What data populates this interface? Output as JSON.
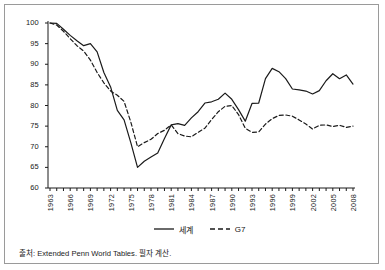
{
  "figure": {
    "source_note": "출처: Extended Penn World Tables. 필자 계산.",
    "border_color": "#9a9a9a",
    "line_color": "#1a1a1a"
  },
  "chart_data": {
    "type": "line",
    "title": "",
    "xlabel": "",
    "ylabel": "",
    "xlim": [
      1963,
      2008
    ],
    "ylim": [
      60,
      100
    ],
    "yticks": [
      60,
      65,
      70,
      75,
      80,
      85,
      90,
      95,
      100
    ],
    "xticks": [
      1963,
      1966,
      1969,
      1972,
      1975,
      1978,
      1981,
      1984,
      1987,
      1990,
      1993,
      1996,
      1999,
      2002,
      2005,
      2008
    ],
    "tick_labels_rotated": true,
    "grid": false,
    "legend_position": "bottom-center",
    "x": [
      1963,
      1964,
      1965,
      1966,
      1967,
      1968,
      1969,
      1970,
      1971,
      1972,
      1973,
      1974,
      1975,
      1976,
      1977,
      1978,
      1979,
      1980,
      1981,
      1982,
      1983,
      1984,
      1985,
      1986,
      1987,
      1988,
      1989,
      1990,
      1991,
      1992,
      1993,
      1994,
      1995,
      1996,
      1997,
      1998,
      1999,
      2000,
      2001,
      2002,
      2003,
      2004,
      2005,
      2006,
      2007,
      2008
    ],
    "series": [
      {
        "name": "세계",
        "style": "solid",
        "values": [
          100.0,
          99.9,
          98.5,
          97.0,
          95.7,
          94.5,
          95.0,
          93.0,
          88.0,
          84.5,
          78.8,
          76.5,
          71.0,
          65.0,
          66.5,
          67.5,
          68.5,
          72.0,
          75.3,
          75.6,
          75.2,
          77.0,
          78.5,
          80.6,
          80.9,
          81.5,
          83.0,
          81.5,
          79.0,
          76.2,
          80.5,
          80.6,
          86.5,
          89.0,
          88.2,
          86.5,
          84.0,
          83.8,
          83.5,
          82.8,
          83.6,
          86.0,
          87.7,
          86.5,
          87.4,
          85.2
        ]
      },
      {
        "name": "G7",
        "style": "dashed",
        "values": [
          100.0,
          99.5,
          98.0,
          96.2,
          94.5,
          93.2,
          91.0,
          88.0,
          85.5,
          83.5,
          82.5,
          81.0,
          76.0,
          70.0,
          71.0,
          71.8,
          73.2,
          74.0,
          75.3,
          73.2,
          72.6,
          72.4,
          73.5,
          74.5,
          76.6,
          78.5,
          79.8,
          80.0,
          77.8,
          74.5,
          73.5,
          73.6,
          75.5,
          76.8,
          77.6,
          77.7,
          77.4,
          76.5,
          75.5,
          74.3,
          75.2,
          75.3,
          74.9,
          75.2,
          74.7,
          75.0
        ]
      }
    ]
  },
  "legend": {
    "items": [
      {
        "label": "세계",
        "style": "solid"
      },
      {
        "label": "G7",
        "style": "dashed"
      }
    ]
  }
}
